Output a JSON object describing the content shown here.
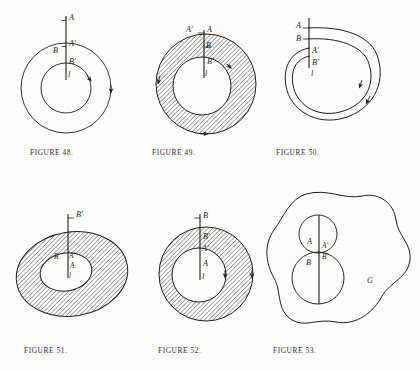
{
  "page": {
    "kind": "textbook-figure-plate",
    "background": "#fdfdfb",
    "ink": "#1d1d1d"
  },
  "figures": [
    {
      "id": "figure-48",
      "caption": "FIGURE 48.",
      "shape": "concentric-annulus-unshaded",
      "shaded": false,
      "labels": [
        {
          "key": "A",
          "text": "A"
        },
        {
          "key": "Ap",
          "text": "A′"
        },
        {
          "key": "B",
          "text": "B"
        },
        {
          "key": "Bp",
          "text": "B′"
        },
        {
          "key": "l",
          "text": "l"
        }
      ]
    },
    {
      "id": "figure-49",
      "caption": "FIGURE 49.",
      "shape": "concentric-annulus-hatched",
      "shaded": true,
      "labels": [
        {
          "key": "Ap",
          "text": "A′"
        },
        {
          "key": "A",
          "text": "A"
        },
        {
          "key": "B",
          "text": "B"
        },
        {
          "key": "Bp",
          "text": "B′"
        },
        {
          "key": "l",
          "text": "l"
        }
      ]
    },
    {
      "id": "figure-50",
      "caption": "FIGURE 50.",
      "shape": "spiral-loop",
      "shaded": false,
      "labels": [
        {
          "key": "A",
          "text": "A"
        },
        {
          "key": "B",
          "text": "B"
        },
        {
          "key": "Ap",
          "text": "A′"
        },
        {
          "key": "Bp",
          "text": "B′"
        },
        {
          "key": "l",
          "text": "l"
        }
      ]
    },
    {
      "id": "figure-51",
      "caption": "FIGURE 51.",
      "shape": "eccentric-annulus-hatched",
      "shaded": true,
      "labels": [
        {
          "key": "Bp",
          "text": "B′"
        },
        {
          "key": "B",
          "text": "B"
        },
        {
          "key": "Ap",
          "text": "A′"
        },
        {
          "key": "A",
          "text": "A"
        },
        {
          "key": "l",
          "text": "l"
        }
      ]
    },
    {
      "id": "figure-52",
      "caption": "FIGURE 52.",
      "shape": "eccentric-annulus-hatched",
      "shaded": true,
      "labels": [
        {
          "key": "B",
          "text": "B"
        },
        {
          "key": "Bp",
          "text": "B′"
        },
        {
          "key": "Ap",
          "text": "A′"
        },
        {
          "key": "A",
          "text": "A"
        },
        {
          "key": "l",
          "text": "l"
        }
      ]
    },
    {
      "id": "figure-53",
      "caption": "FIGURE 53.",
      "shape": "blob-with-two-circles",
      "shaded": false,
      "labels": [
        {
          "key": "A",
          "text": "A"
        },
        {
          "key": "Ap",
          "text": "A′"
        },
        {
          "key": "Bp",
          "text": "B′"
        },
        {
          "key": "B",
          "text": "B"
        },
        {
          "key": "G",
          "text": "G"
        }
      ]
    }
  ]
}
